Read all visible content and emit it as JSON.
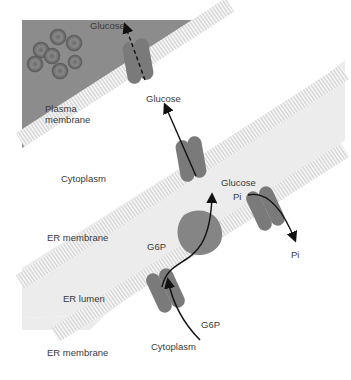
{
  "diagram": {
    "regions": {
      "extracellular": {
        "color": "#8c8c8c"
      },
      "cytoplasm_upper": {
        "label": "Cytoplasm",
        "color": "#ffffff"
      },
      "er_lumen": {
        "label": "ER lumen",
        "color": "#ececec"
      },
      "cytoplasm_lower": {
        "label": "Cytoplasm",
        "color": "#ffffff"
      }
    },
    "membranes": {
      "plasma": {
        "label_line1": "Plasma",
        "label_line2": "membrane"
      },
      "er_upper": {
        "label": "ER membrane"
      },
      "er_lower": {
        "label": "ER membrane"
      }
    },
    "molecules": {
      "glucose_out": "Glucose",
      "glucose_plasma_in": "Glucose",
      "glucose_er": "Glucose",
      "pi_in": "Pi",
      "pi_out": "Pi",
      "g6p_lumen": "G6P",
      "g6p_cyto": "G6P"
    },
    "colors": {
      "membrane": "#d0d0d0",
      "transporter": "#7a7a7a",
      "enzyme": "#858585",
      "arrow": "#111111",
      "red_cells": "#5a5a5a"
    }
  }
}
